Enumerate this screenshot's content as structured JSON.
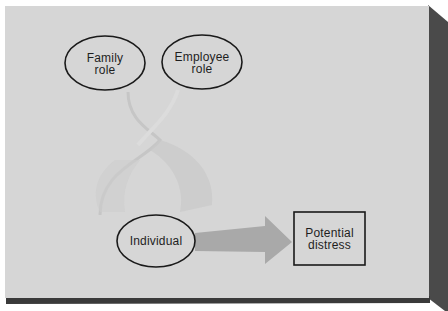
{
  "diagram": {
    "nodes": [
      {
        "id": "family-role",
        "shape": "ellipse",
        "lines": [
          "Family",
          "role"
        ]
      },
      {
        "id": "employee-role",
        "shape": "ellipse",
        "lines": [
          "Employee",
          "role"
        ]
      },
      {
        "id": "individual",
        "shape": "ellipse",
        "lines": [
          "Individual"
        ]
      },
      {
        "id": "potential-distress",
        "shape": "rectangle",
        "lines": [
          "Potential",
          "distress"
        ]
      }
    ],
    "edges": [
      {
        "from": "individual",
        "to": "potential-distress",
        "style": "block-arrow"
      },
      {
        "from": "family-role",
        "to": "individual",
        "style": "faint-curved"
      },
      {
        "from": "employee-role",
        "to": "individual",
        "style": "faint-curved"
      }
    ]
  },
  "colors": {
    "panel": "#d6d6d6",
    "panel_side": "#4a4a4a",
    "panel_bottom": "#3a3a3a",
    "outline": "#1a1a1a",
    "arrow": "#a9a9a9",
    "faint_shape": "#cbcbcb"
  }
}
